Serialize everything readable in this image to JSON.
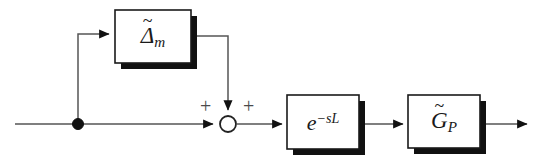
{
  "diagram": {
    "canvas": {
      "width": 543,
      "height": 165,
      "background": "#ffffff"
    },
    "colors": {
      "line": "#555555",
      "block_stroke": "#1a1a1a",
      "block_fill": "#ffffff",
      "shadow": "#111111",
      "sign_text": "#4a4a4a"
    },
    "blocks": [
      {
        "id": "uncertainty",
        "label_base": "Δ",
        "label_tilde": "~",
        "label_subscript": "m",
        "label_plain": "Δ̃ₘ",
        "x": 115,
        "y": 10,
        "width": 76,
        "height": 53
      },
      {
        "id": "delay",
        "label_base": "e",
        "label_superscript": "−sL",
        "label_plain": "e⁻ˢᴸ",
        "x": 287,
        "y": 95,
        "width": 72,
        "height": 54
      },
      {
        "id": "plant",
        "label_base": "G",
        "label_tilde": "~",
        "label_subscript": "P",
        "label_plain": "G̃ₚ",
        "x": 408,
        "y": 95,
        "width": 72,
        "height": 53
      }
    ],
    "summing_junction": {
      "id": "sum",
      "cx": 228,
      "cy": 124,
      "r": 8,
      "signs": [
        {
          "label": "+",
          "x": 200,
          "y": 96
        },
        {
          "label": "+",
          "x": 243,
          "y": 96
        }
      ]
    },
    "branch_point": {
      "id": "branch",
      "cx": 78,
      "cy": 124,
      "r": 5.5
    },
    "signals": [
      {
        "id": "input-line",
        "from": "input",
        "to": "branch"
      },
      {
        "id": "branch-to-uncertainty",
        "from": "branch",
        "to": "uncertainty"
      },
      {
        "id": "uncertainty-to-sum",
        "from": "uncertainty",
        "to": "sum"
      },
      {
        "id": "branch-to-sum",
        "from": "branch",
        "to": "sum"
      },
      {
        "id": "sum-to-delay",
        "from": "sum",
        "to": "delay"
      },
      {
        "id": "delay-to-plant",
        "from": "delay",
        "to": "plant"
      },
      {
        "id": "plant-to-output",
        "from": "plant",
        "to": "output"
      }
    ]
  }
}
